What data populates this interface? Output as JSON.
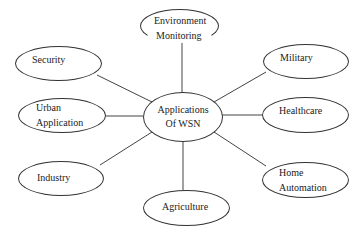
{
  "diagram": {
    "center": {
      "line1": "Applications",
      "line2": "Of WSN"
    },
    "nodes": {
      "environment": {
        "line1": "Environment",
        "line2": "Monitoring"
      },
      "security": {
        "label": "Security"
      },
      "military": {
        "label": "Military"
      },
      "urban": {
        "line1": "Urban",
        "line2": "Application"
      },
      "healthcare": {
        "label": "Healthcare"
      },
      "industry": {
        "label": "Industry"
      },
      "home": {
        "line1": "Home",
        "line2": "Automation"
      },
      "agriculture": {
        "label": "Agriculture"
      }
    },
    "colors": {
      "stroke": "#333333",
      "background": "#ffffff",
      "text": "#222222"
    }
  }
}
